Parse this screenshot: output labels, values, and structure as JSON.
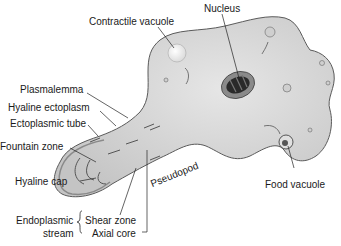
{
  "labels": {
    "contractile_vacuole": "Contractile vacuole",
    "nucleus": "Nucleus",
    "plasmalemma": "Plasmalemma",
    "hyaline_ectoplasm": "Hyaline ectoplasm",
    "ectoplasmic_tube": "Ectoplasmic tube",
    "fountain_zone": "Fountain zone",
    "hyaline_cap": "Hyaline cap",
    "pseudopod": "Pseudopod",
    "food_vacuole": "Food vacuole",
    "endoplasmic": "Endoplasmic",
    "stream": "stream",
    "shear_zone": "Shear zone",
    "axial_core": "Axial core"
  },
  "colors": {
    "cell_fill": "#d6d6d6",
    "cell_outline": "#5a5a5a",
    "nucleus_dark": "#2a2a2a",
    "leader_line": "#222222"
  }
}
